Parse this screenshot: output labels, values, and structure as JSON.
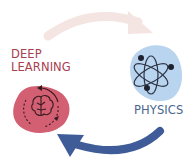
{
  "diagram": {
    "nodes": [
      {
        "id": "deep-learning",
        "label_lines": [
          "DEEP",
          "LEARNING"
        ],
        "icon": "brain-cycle-icon",
        "blob_color": "#d25f72",
        "text_color": "#a8404f"
      },
      {
        "id": "physics",
        "label": "PHYSICS",
        "icon": "atom-icon",
        "blob_color": "#b9d4ee",
        "text_color": "#4a6690"
      }
    ],
    "edges": [
      {
        "from": "deep-learning",
        "to": "physics",
        "style": "curved-arrow-top",
        "color": "#f4e4e2"
      },
      {
        "from": "physics",
        "to": "deep-learning",
        "style": "curved-arrow-bottom",
        "color": "#3f5b98"
      }
    ]
  },
  "labels": {
    "deep_line1": "DEEP",
    "deep_line2": "LEARNING",
    "physics": "PHYSICS"
  }
}
